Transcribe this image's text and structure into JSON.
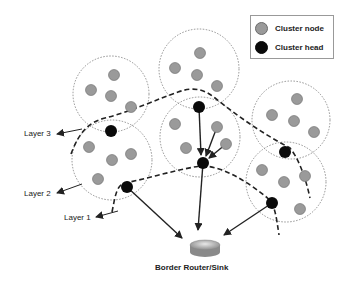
{
  "legend": {
    "items": [
      {
        "label": "Cluster node",
        "color": "#9a9a9a"
      },
      {
        "label": "Cluster head",
        "color": "#000000"
      }
    ]
  },
  "layers": [
    {
      "label": "Layer 3"
    },
    {
      "label": "Layer 2"
    },
    {
      "label": "Layer 1"
    }
  ],
  "sink": {
    "label": "Border Router/Sink"
  },
  "colors": {
    "node": "#9a9a9a",
    "head": "#0a0a0a",
    "line": "#222222"
  }
}
